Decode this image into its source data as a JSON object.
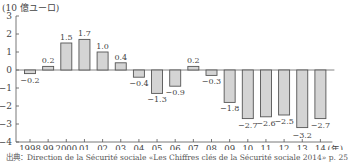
{
  "chart_data": {
    "type": "bar",
    "title": "",
    "unit_label": "(10 億ユーロ)",
    "xlabel": "(年)",
    "ylabel": "10 億ユーロ",
    "categories": [
      "1998",
      "99",
      "2000",
      "01",
      "02",
      "03",
      "04",
      "05",
      "06",
      "07",
      "08",
      "09",
      "10",
      "11",
      "12",
      "13",
      "14"
    ],
    "values": [
      -0.2,
      0.2,
      1.5,
      1.7,
      1.0,
      0.4,
      -0.4,
      -1.3,
      -0.9,
      0.2,
      -0.3,
      -1.8,
      -2.7,
      -2.6,
      -2.5,
      -3.2,
      -2.7
    ],
    "value_labels": [
      "-0.2",
      "0.2",
      "1.5",
      "1.7",
      "1.0",
      "0.4",
      "-0.4",
      "-1.3",
      "-0.9",
      "0.2",
      "-0.3",
      "-1.8",
      "-2.7",
      "-2.6",
      "-2.5",
      "-3.2",
      "-2.7"
    ],
    "ylim": [
      -4,
      3
    ],
    "yticks": [
      3,
      2,
      1,
      0,
      -1,
      -2,
      -3,
      -4
    ],
    "ytick_labels": [
      "3",
      "2",
      "1",
      "0",
      "−1",
      "−2",
      "−3",
      "−4"
    ],
    "grid": false,
    "legend": null,
    "bar_fill": "#d4d4d4",
    "bar_stroke": "#555555"
  },
  "header": {
    "unit_label": "(10 億ユーロ)"
  },
  "footer": {
    "source": "出典：Direction de la Sécurité sociale «Les Chiffres clés de la Sécurité sociale 2014» p. 25"
  }
}
